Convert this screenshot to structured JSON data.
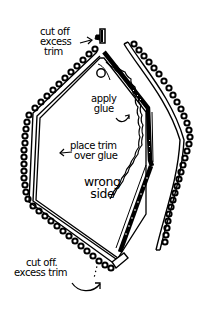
{
  "diagram": {
    "title": "",
    "colors": {
      "ink": "#000000",
      "paper": "#ffffff"
    },
    "labels": {
      "cut_top": {
        "lines": [
          "cut off",
          "excess",
          "trim"
        ],
        "arrow": "right-arrow"
      },
      "apply_glue": {
        "lines": [
          "apply",
          "glue"
        ],
        "arrow": "curved-arrow"
      },
      "place_trim": {
        "lines": [
          "place trim",
          "over glue"
        ],
        "arrow": "left-arrow"
      },
      "wrong_side": {
        "lines": [
          "wrong",
          "side"
        ]
      },
      "cut_bottom": {
        "lines": [
          "cut off.",
          "excess trim"
        ],
        "arrow": "curved-arrow"
      }
    },
    "parts": [
      {
        "name": "fabric-panel",
        "description": "hexagonal fabric piece, wrong side up"
      },
      {
        "name": "loop-trim-applied",
        "description": "scalloped loop trim glued around left edge"
      },
      {
        "name": "glue-line",
        "description": "wavy glue line along right edge"
      },
      {
        "name": "loop-trim-strip",
        "description": "separate strip of loop trim being placed on right"
      },
      {
        "name": "cut-trim-end-top",
        "description": "small cut-off piece of trim at top"
      },
      {
        "name": "cut-trim-end-bottom",
        "description": "overlapping trim end at bottom to be cut"
      }
    ]
  }
}
